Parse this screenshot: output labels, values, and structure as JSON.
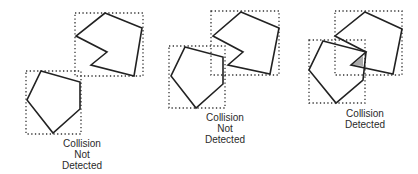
{
  "panels": [
    {
      "id": "panel-1",
      "caption": [
        "Collision",
        "Not",
        "Detected"
      ],
      "result": "not-detected",
      "caption_pos": {
        "x": 47,
        "y": 138
      },
      "shapes": [
        {
          "name": "notched-polygon",
          "bbox": [
            75,
            13,
            143,
            76
          ],
          "points": "105,13 142,28 134,76 91,65 107,52 76,36"
        },
        {
          "name": "pentagon",
          "bbox": [
            26,
            71,
            81,
            134
          ],
          "points": "41,71 80,82 80,109 53,133 27,100"
        }
      ]
    },
    {
      "id": "panel-2",
      "caption": [
        "Collision",
        "Not",
        "Detected"
      ],
      "result": "not-detected",
      "caption_pos": {
        "x": 190,
        "y": 112
      },
      "shapes": [
        {
          "name": "notched-polygon",
          "bbox": [
            211,
            11,
            279,
            75
          ],
          "points": "241,12 279,28 270,74 228,65 243,52 213,36"
        },
        {
          "name": "pentagon",
          "bbox": [
            169,
            46,
            225,
            108
          ],
          "points": "185,47 223,57 223,84 196,108 171,76"
        }
      ]
    },
    {
      "id": "panel-3",
      "caption": [
        "Collision",
        "Detected"
      ],
      "result": "detected",
      "caption_pos": {
        "x": 330,
        "y": 108
      },
      "shapes": [
        {
          "name": "notched-polygon",
          "bbox": [
            335,
            11,
            402,
            75
          ],
          "points": "365,12 402,29 393,74 351,65 366,52 335,36"
        },
        {
          "name": "pentagon",
          "bbox": [
            309,
            40,
            365,
            103
          ],
          "points": "323,41 366,52 363,80 336,103 309,70"
        }
      ],
      "overlap": {
        "name": "overlap-region",
        "points": "352,65 363,56 363,66",
        "color": "#a9a9a9"
      }
    }
  ]
}
